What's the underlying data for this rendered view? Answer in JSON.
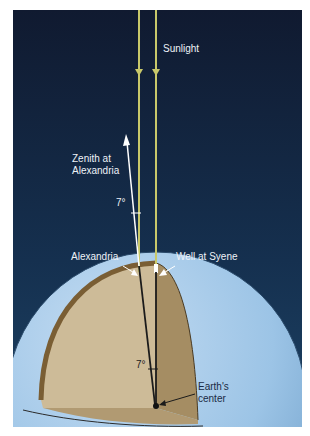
{
  "diagram": {
    "labels": {
      "sunlight": "Sunlight",
      "zenith_line1": "Zenith at",
      "zenith_line2": "Alexandria",
      "angle_top": "7°",
      "alexandria": "Alexandria",
      "well": "Well at Syene",
      "angle_center": "7°",
      "center_line1": "Earth's",
      "center_line2": "center"
    },
    "colors": {
      "sky_top": "#111d33",
      "sky_bottom": "#1a3a5c",
      "sunlight_ray": "#c8c86a",
      "zenith_arrow": "#ffffff",
      "earth_surface": "#9cc4e6",
      "cutaway_face": "#cdbb98",
      "cutaway_rim": "#7a5e34",
      "cutaway_side": "#a28a62",
      "radius_line": "#1b1b1b"
    }
  }
}
